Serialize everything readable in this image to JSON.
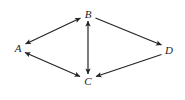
{
  "diagram": {
    "type": "directed-graph",
    "canvas": {
      "width": 185,
      "height": 100,
      "background": "#ffffff"
    },
    "style": {
      "edge_color": "#242424",
      "edge_width": 1.2,
      "arrow_color": "#242424",
      "label_color": "#1d1d1d",
      "label_font_size": 11,
      "label_font_style": "italic"
    },
    "nodes": [
      {
        "id": "A",
        "label": "A",
        "x": 18,
        "y": 48
      },
      {
        "id": "B",
        "label": "B",
        "x": 88,
        "y": 14
      },
      {
        "id": "C",
        "label": "C",
        "x": 88,
        "y": 81
      },
      {
        "id": "D",
        "label": "D",
        "x": 169,
        "y": 50
      }
    ],
    "edges": [
      {
        "id": "edge-a-b",
        "from": "A",
        "to": "B",
        "direction": "bidirectional",
        "arrow_start": true,
        "arrow_end": true
      },
      {
        "id": "edge-a-c",
        "from": "A",
        "to": "C",
        "direction": "bidirectional",
        "arrow_start": true,
        "arrow_end": true
      },
      {
        "id": "edge-b-c",
        "from": "B",
        "to": "C",
        "direction": "bidirectional",
        "arrow_start": true,
        "arrow_end": true
      },
      {
        "id": "edge-b-d",
        "from": "B",
        "to": "D",
        "direction": "forward",
        "arrow_start": false,
        "arrow_end": true
      },
      {
        "id": "edge-d-c",
        "from": "D",
        "to": "C",
        "direction": "forward",
        "arrow_start": false,
        "arrow_end": true
      }
    ]
  }
}
